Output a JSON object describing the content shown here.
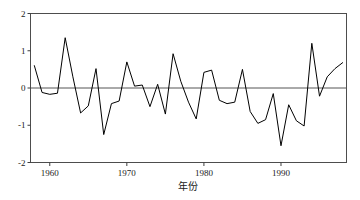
{
  "chart_data": {
    "type": "line",
    "title": "",
    "subtitle": "",
    "xlabel": "年份",
    "ylabel": "",
    "xlim": [
      1957.5,
      1998.5
    ],
    "ylim": [
      -2,
      2
    ],
    "grid": false,
    "legend": null,
    "reference_lines": [
      {
        "axis": "y",
        "value": 0,
        "color": "#555555"
      }
    ],
    "xticks": [
      1960,
      1970,
      1980,
      1990
    ],
    "xtick_labels": [
      "1960",
      "1970",
      "1980",
      "1990"
    ],
    "yticks": [
      -2,
      -1,
      0,
      1,
      2
    ],
    "ytick_labels": [
      "-2",
      "-1",
      "0",
      "1",
      "2"
    ],
    "series": [
      {
        "name": "series-1",
        "color": "#000000",
        "x": [
          1958,
          1959,
          1960,
          1961,
          1962,
          1963,
          1964,
          1965,
          1966,
          1967,
          1968,
          1969,
          1970,
          1971,
          1972,
          1973,
          1974,
          1975,
          1976,
          1977,
          1978,
          1979,
          1980,
          1981,
          1982,
          1983,
          1984,
          1985,
          1986,
          1987,
          1988,
          1989,
          1990,
          1991,
          1992,
          1993,
          1994,
          1995,
          1996,
          1997,
          1998
        ],
        "values": [
          0.6,
          -0.12,
          -0.17,
          -0.14,
          1.35,
          0.3,
          -0.67,
          -0.48,
          0.52,
          -1.25,
          -0.42,
          -0.35,
          0.7,
          0.05,
          0.08,
          -0.5,
          0.1,
          -0.7,
          0.92,
          0.18,
          -0.38,
          -0.83,
          0.42,
          0.48,
          -0.33,
          -0.42,
          -0.38,
          0.5,
          -0.63,
          -0.95,
          -0.85,
          -0.15,
          -1.55,
          -0.45,
          -0.88,
          -1.02,
          1.2,
          -0.22,
          0.3,
          0.52,
          0.68
        ],
        "annual_values_note": "annual anomaly index"
      }
    ],
    "extremes": {
      "max_value": 1.35,
      "max_year": 1962,
      "min_value": -1.55,
      "min_year": 1988
    }
  },
  "axis": {
    "x_label": "年份",
    "y_label": ""
  }
}
